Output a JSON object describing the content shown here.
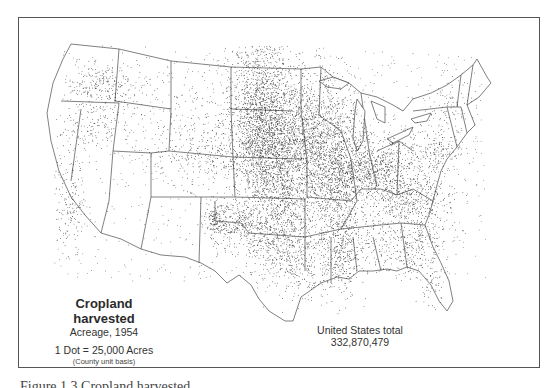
{
  "map": {
    "type": "dot-distribution",
    "subject": "Cropland harvested",
    "region": "United States (contiguous)"
  },
  "legend": {
    "title": "Cropland harvested",
    "subtitle": "Acreage, 1954",
    "scale": "1 Dot = 25,000 Acres",
    "basis": "(County unit basis)"
  },
  "total": {
    "label": "United States total",
    "value": "332,870,479"
  },
  "caption": {
    "text": "Figure 1.3  Cropland harvested"
  },
  "colors": {
    "ink": "#2a2a2a",
    "outline": "#555555",
    "background": "#ffffff"
  }
}
